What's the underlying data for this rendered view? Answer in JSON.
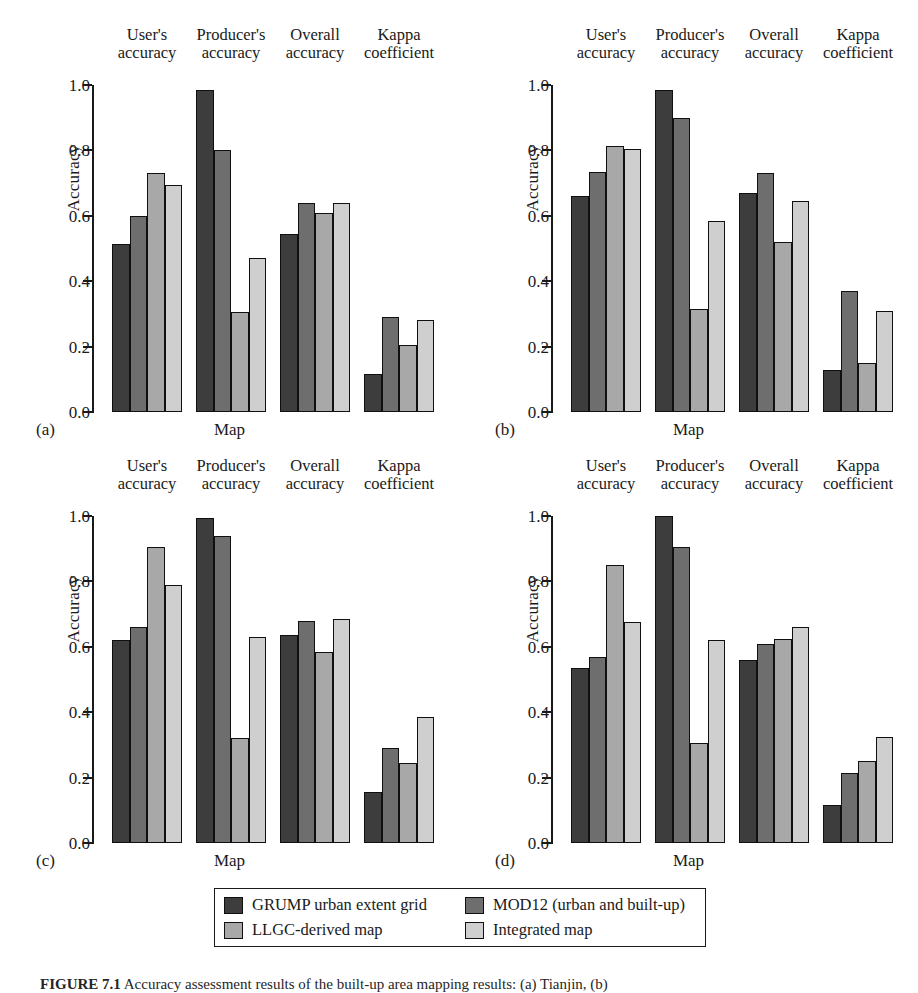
{
  "figure": {
    "caption_prefix": "FIGURE 7.1",
    "caption_text": "Accuracy assessment results of the built-up area mapping results: (a) Tianjin, (b)",
    "axis": {
      "ylabel": "Accuracy",
      "xlabel": "Map",
      "yticks": [
        "0.0",
        "0.2",
        "0.4",
        "0.6",
        "0.8",
        "1.0"
      ],
      "ymin": 0.0,
      "ymax": 1.0
    },
    "group_labels": [
      {
        "line1": "User's",
        "line2": "accuracy"
      },
      {
        "line1": "Producer's",
        "line2": "accuracy"
      },
      {
        "line1": "Overall",
        "line2": "accuracy"
      },
      {
        "line1": "Kappa",
        "line2": "coefficient"
      }
    ],
    "panel_letters": [
      "(a)",
      "(b)",
      "(c)",
      "(d)"
    ]
  },
  "legend": {
    "items": [
      {
        "label": "GRUMP urban extent grid",
        "color": "#3d3d3d"
      },
      {
        "label": "MOD12 (urban and built-up)",
        "color": "#6e6e6e"
      },
      {
        "label": "LLGC-derived map",
        "color": "#a8a8a8"
      },
      {
        "label": "Integrated map",
        "color": "#cfcfcf"
      }
    ]
  },
  "chart_data": [
    {
      "type": "bar",
      "panel": "(a)",
      "title": "",
      "xlabel": "Map",
      "ylabel": "Accuracy",
      "ylim": [
        0.0,
        1.0
      ],
      "grid": false,
      "legend_position": "below-figure",
      "categories": [
        "User's accuracy",
        "Producer's accuracy",
        "Overall accuracy",
        "Kappa coefficient"
      ],
      "series": [
        {
          "name": "GRUMP urban extent grid",
          "color": "#3d3d3d",
          "values": [
            0.515,
            0.985,
            0.545,
            0.115
          ]
        },
        {
          "name": "MOD12 (urban and built-up)",
          "color": "#6e6e6e",
          "values": [
            0.6,
            0.8,
            0.64,
            0.29
          ]
        },
        {
          "name": "LLGC-derived map",
          "color": "#a8a8a8",
          "values": [
            0.73,
            0.305,
            0.61,
            0.205
          ]
        },
        {
          "name": "Integrated map",
          "color": "#cfcfcf",
          "values": [
            0.695,
            0.47,
            0.64,
            0.28
          ]
        }
      ]
    },
    {
      "type": "bar",
      "panel": "(b)",
      "title": "",
      "xlabel": "Map",
      "ylabel": "Accuracy",
      "ylim": [
        0.0,
        1.0
      ],
      "grid": false,
      "legend_position": "below-figure",
      "categories": [
        "User's accuracy",
        "Producer's accuracy",
        "Overall accuracy",
        "Kappa coefficient"
      ],
      "series": [
        {
          "name": "GRUMP urban extent grid",
          "color": "#3d3d3d",
          "values": [
            0.66,
            0.985,
            0.67,
            0.13
          ]
        },
        {
          "name": "MOD12 (urban and built-up)",
          "color": "#6e6e6e",
          "values": [
            0.735,
            0.9,
            0.73,
            0.37
          ]
        },
        {
          "name": "LLGC-derived map",
          "color": "#a8a8a8",
          "values": [
            0.815,
            0.315,
            0.52,
            0.15
          ]
        },
        {
          "name": "Integrated map",
          "color": "#cfcfcf",
          "values": [
            0.805,
            0.585,
            0.645,
            0.31
          ]
        }
      ]
    },
    {
      "type": "bar",
      "panel": "(c)",
      "title": "",
      "xlabel": "Map",
      "ylabel": "Accuracy",
      "ylim": [
        0.0,
        1.0
      ],
      "grid": false,
      "legend_position": "below-figure",
      "categories": [
        "User's accuracy",
        "Producer's accuracy",
        "Overall accuracy",
        "Kappa coefficient"
      ],
      "series": [
        {
          "name": "GRUMP urban extent grid",
          "color": "#3d3d3d",
          "values": [
            0.62,
            0.995,
            0.635,
            0.155
          ]
        },
        {
          "name": "MOD12 (urban and built-up)",
          "color": "#6e6e6e",
          "values": [
            0.66,
            0.94,
            0.68,
            0.29
          ]
        },
        {
          "name": "LLGC-derived map",
          "color": "#a8a8a8",
          "values": [
            0.905,
            0.32,
            0.585,
            0.245
          ]
        },
        {
          "name": "Integrated map",
          "color": "#cfcfcf",
          "values": [
            0.79,
            0.63,
            0.685,
            0.385
          ]
        }
      ]
    },
    {
      "type": "bar",
      "panel": "(d)",
      "title": "",
      "xlabel": "Map",
      "ylabel": "Accuracy",
      "ylim": [
        0.0,
        1.0
      ],
      "grid": false,
      "legend_position": "below-figure",
      "categories": [
        "User's accuracy",
        "Producer's accuracy",
        "Overall accuracy",
        "Kappa coefficient"
      ],
      "series": [
        {
          "name": "GRUMP urban extent grid",
          "color": "#3d3d3d",
          "values": [
            0.535,
            1.0,
            0.56,
            0.115
          ]
        },
        {
          "name": "MOD12 (urban and built-up)",
          "color": "#6e6e6e",
          "values": [
            0.57,
            0.905,
            0.61,
            0.215
          ]
        },
        {
          "name": "LLGC-derived map",
          "color": "#a8a8a8",
          "values": [
            0.85,
            0.305,
            0.625,
            0.25
          ]
        },
        {
          "name": "Integrated map",
          "color": "#cfcfcf",
          "values": [
            0.675,
            0.62,
            0.66,
            0.325
          ]
        }
      ]
    }
  ]
}
